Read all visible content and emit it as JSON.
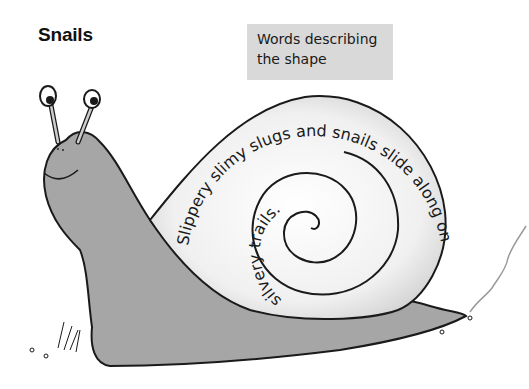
{
  "page": {
    "title": "Snails"
  },
  "label": {
    "line1": "Words describing",
    "line2": "the shape"
  },
  "poem": {
    "outer": "Slippery slimy slugs and snails slide along on",
    "inner": "silvery trails."
  },
  "colors": {
    "body": "#a6a6a6",
    "shell": "#f2f2f2",
    "label_bg": "#d9d9d9",
    "outline": "#1a1a1a"
  }
}
